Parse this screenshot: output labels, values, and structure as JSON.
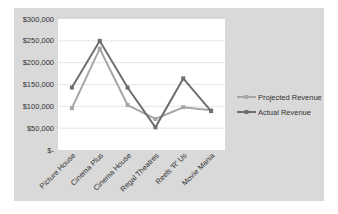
{
  "chart_data": {
    "type": "line",
    "title": "",
    "xlabel": "",
    "ylabel": "",
    "categories": [
      "Picture House",
      "Cinema Plus",
      "Cinema House",
      "Regal Theatres",
      "Reels 'R' Us",
      "Movie Mania"
    ],
    "series": [
      {
        "name": "Projected Revenue",
        "color": "#a6a6a6",
        "values": [
          96000,
          232000,
          103000,
          71000,
          98000,
          91000
        ]
      },
      {
        "name": "Actual Revenue",
        "color": "#6e6e6e",
        "values": [
          143000,
          250000,
          143000,
          52000,
          164000,
          89000
        ]
      }
    ],
    "ylim": [
      0,
      300000
    ],
    "yticks": [
      "$300,000",
      "$250,000",
      "$200,000",
      "$150,000",
      "$100,000",
      "$50,000",
      "$-"
    ],
    "grid": true,
    "legend_position": "right"
  },
  "colors": {
    "frame_bg": "#d9d9d9",
    "plot_bg": "#ffffff",
    "gridline": "#e6e6e6"
  }
}
